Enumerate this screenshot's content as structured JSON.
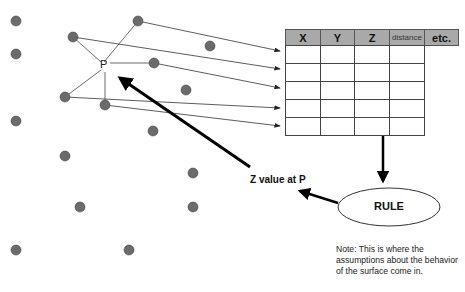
{
  "diagram": {
    "point_label": "P",
    "table": {
      "headers": [
        "X",
        "Y",
        "Z",
        "distance",
        "etc."
      ],
      "row_count": 5,
      "header_color": "#a9a9a9"
    },
    "rule_label": "RULE",
    "output_label": "Z value at P",
    "note": "Note: This is where the assumptions about the behavior of the surface come in.",
    "dot_color": "#6b6b6b",
    "dots": [
      {
        "x": 16,
        "y": 21
      },
      {
        "x": 138,
        "y": 21
      },
      {
        "x": 73,
        "y": 37
      },
      {
        "x": 16,
        "y": 54
      },
      {
        "x": 210,
        "y": 46
      },
      {
        "x": 154,
        "y": 63
      },
      {
        "x": 186,
        "y": 90
      },
      {
        "x": 65,
        "y": 97
      },
      {
        "x": 105,
        "y": 105
      },
      {
        "x": 16,
        "y": 121
      },
      {
        "x": 153,
        "y": 131
      },
      {
        "x": 65,
        "y": 156
      },
      {
        "x": 193,
        "y": 173
      },
      {
        "x": 80,
        "y": 207
      },
      {
        "x": 193,
        "y": 207
      },
      {
        "x": 16,
        "y": 250
      },
      {
        "x": 129,
        "y": 250
      }
    ]
  }
}
